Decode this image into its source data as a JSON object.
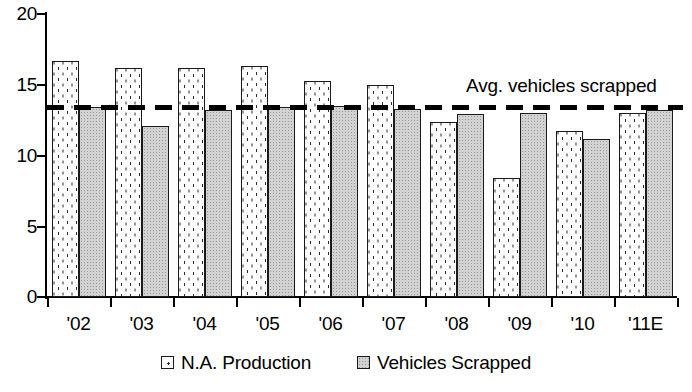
{
  "chart_data": {
    "type": "bar",
    "title": "",
    "subtitle": "",
    "xlabel": "",
    "ylabel": "",
    "categories": [
      "'02",
      "'03",
      "'04",
      "'05",
      "'06",
      "'07",
      "'08",
      "'09",
      "'10",
      "'11E"
    ],
    "series": [
      {
        "name": "N.A. Production",
        "values": [
          16.7,
          16.2,
          16.2,
          16.3,
          15.3,
          15.0,
          12.4,
          8.4,
          11.7,
          13.0
        ]
      },
      {
        "name": "Vehicles Scrapped",
        "values": [
          13.4,
          12.1,
          13.2,
          13.4,
          13.5,
          13.3,
          12.9,
          13.0,
          11.2,
          13.2
        ]
      }
    ],
    "ylim": [
      0,
      20
    ],
    "yticks": [
      0,
      5,
      10,
      15,
      20
    ],
    "ytick_labels": [
      "0",
      "5",
      "10",
      "15",
      "20"
    ],
    "grid": false,
    "legend_position": "bottom",
    "annotations": [
      {
        "name": "avg-vehicles-scrapped",
        "label": "Avg. vehicles scrapped",
        "value": 13.4,
        "style": "dashed-horizontal-line"
      }
    ],
    "colors": {
      "production_fill": "#fdfdfd",
      "production_border": "#1a1a1a",
      "scrapped_fill": "#d2d2d2",
      "scrapped_border": "#1a1a1a",
      "axis": "#000000",
      "average_line": "#000000",
      "text": "#000000"
    }
  },
  "legend": {
    "items": [
      {
        "label": "N.A. Production",
        "swatch": "dotted-square-icon"
      },
      {
        "label": "Vehicles Scrapped",
        "swatch": "gray-square-icon"
      }
    ]
  },
  "source": {
    "text": ""
  }
}
